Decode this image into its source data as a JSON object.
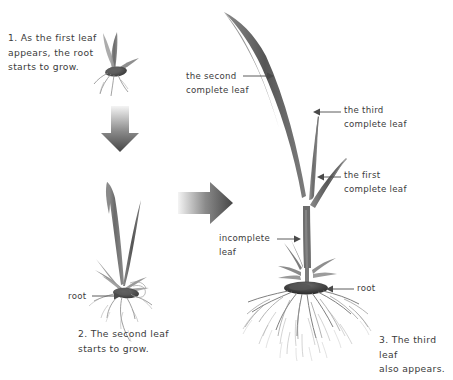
{
  "diagram": {
    "background_color": "#ffffff",
    "text_color": "#3b3b3b",
    "plant_color": "#6f6f6f",
    "arrow_gradient": [
      "#f2f2f2",
      "#4a4a4a"
    ]
  },
  "captions": [
    {
      "id": "stage-1",
      "text": "1. As the first leaf\nappears, the root\nstarts to grow."
    },
    {
      "id": "stage-2",
      "text": "2. The second leaf\nstarts to grow."
    },
    {
      "id": "stage-3",
      "text": "3. The third leaf\nalso appears."
    }
  ],
  "labels": {
    "second_complete_leaf": "the second\ncomplete leaf",
    "third_complete_leaf": "the third\ncomplete leaf",
    "first_complete_leaf": "the first\ncomplete leaf",
    "incomplete_leaf": "incomplete\nleaf",
    "root_stage2": "root",
    "root_stage3": "root"
  },
  "flow_arrows": [
    {
      "name": "down-arrow",
      "direction": "down",
      "from": "stage-1",
      "to": "stage-2"
    },
    {
      "name": "right-arrow",
      "direction": "right",
      "from": "stage-2",
      "to": "stage-3"
    }
  ],
  "pointer_arrows": [
    {
      "name": "second-complete-leaf-pointer",
      "direction": "right"
    },
    {
      "name": "third-complete-leaf-pointer",
      "direction": "left"
    },
    {
      "name": "first-complete-leaf-pointer",
      "direction": "left"
    },
    {
      "name": "incomplete-leaf-pointer",
      "direction": "right"
    },
    {
      "name": "root-stage2-pointer",
      "direction": "right"
    },
    {
      "name": "root-stage3-pointer",
      "direction": "left"
    }
  ]
}
